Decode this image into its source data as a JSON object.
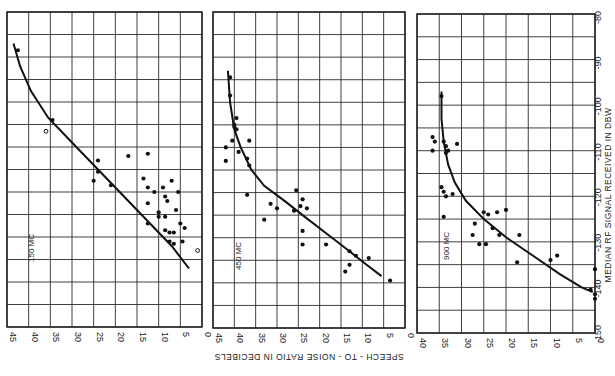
{
  "chart_data": {
    "type": "scatter",
    "orientation_note": "Figure printed rotated 90 degrees clockwise",
    "shared": {
      "xlabel": "SPEECH - TO - NOISE RATIO IN DECIBELS",
      "ylabel": "MEDIAN RF SIGNAL RECEIVED IN DBW",
      "rf_ticks": [
        "-80",
        "-90",
        "-100",
        "-110",
        "-120",
        "-130",
        "-140",
        "-150"
      ],
      "rf_range": [
        -150,
        -80
      ],
      "grid": true
    },
    "panels": [
      {
        "label": "150 MC",
        "sn_ticks": [
          "45",
          "40",
          "35",
          "30",
          "25",
          "20",
          "15",
          "10",
          "5",
          "0"
        ],
        "sn_range": [
          0,
          45
        ],
        "curve": [
          [
            43.5,
            -87
          ],
          [
            42,
            -92
          ],
          [
            39.5,
            -97.5
          ],
          [
            35.5,
            -103.5
          ],
          [
            30,
            -109
          ],
          [
            24,
            -115
          ],
          [
            18,
            -121
          ],
          [
            12,
            -127
          ],
          [
            7,
            -132
          ],
          [
            3,
            -137
          ]
        ],
        "points": [
          {
            "sn": 42.5,
            "rf": -88.5
          },
          {
            "sn": 34.5,
            "rf": -104
          },
          {
            "sn": 36,
            "rf": -106.5,
            "open": true
          },
          {
            "sn": 24,
            "rf": -113
          },
          {
            "sn": 24,
            "rf": -115.5
          },
          {
            "sn": 25,
            "rf": -117.5
          },
          {
            "sn": 21,
            "rf": -118.5
          },
          {
            "sn": 17,
            "rf": -112
          },
          {
            "sn": 12.5,
            "rf": -111.5
          },
          {
            "sn": 13.5,
            "rf": -117
          },
          {
            "sn": 12.5,
            "rf": -119
          },
          {
            "sn": 11,
            "rf": -120
          },
          {
            "sn": 12.5,
            "rf": -122.5
          },
          {
            "sn": 12.5,
            "rf": -127
          },
          {
            "sn": 9,
            "rf": -119
          },
          {
            "sn": 8.5,
            "rf": -121
          },
          {
            "sn": 8,
            "rf": -122
          },
          {
            "sn": 7,
            "rf": -117.5
          },
          {
            "sn": 5.5,
            "rf": -120
          },
          {
            "sn": 10,
            "rf": -124.5
          },
          {
            "sn": 10,
            "rf": -125.5
          },
          {
            "sn": 8.5,
            "rf": -125.5
          },
          {
            "sn": 6,
            "rf": -124
          },
          {
            "sn": 5,
            "rf": -127
          },
          {
            "sn": 8.5,
            "rf": -128.5
          },
          {
            "sn": 7.5,
            "rf": -129
          },
          {
            "sn": 6.5,
            "rf": -129
          },
          {
            "sn": 4,
            "rf": -128
          },
          {
            "sn": 7.5,
            "rf": -131
          },
          {
            "sn": 6.5,
            "rf": -131.5
          },
          {
            "sn": 4.5,
            "rf": -131
          },
          {
            "sn": 1,
            "rf": -133,
            "open": true
          }
        ]
      },
      {
        "label": "450 MC",
        "sn_ticks": [
          "45",
          "40",
          "35",
          "30",
          "25",
          "20",
          "15",
          "10",
          "5",
          "0"
        ],
        "sn_range": [
          0,
          45
        ],
        "curve": [
          [
            41.5,
            -93
          ],
          [
            41,
            -100
          ],
          [
            40,
            -106
          ],
          [
            38.5,
            -110
          ],
          [
            36,
            -115
          ],
          [
            33,
            -118.5
          ],
          [
            28,
            -122
          ],
          [
            24,
            -125
          ],
          [
            18.5,
            -129
          ],
          [
            13,
            -133
          ],
          [
            9,
            -136
          ],
          [
            5.5,
            -138.5
          ]
        ],
        "points": [
          {
            "sn": 41,
            "rf": -94.5
          },
          {
            "sn": 41,
            "rf": -98.5
          },
          {
            "sn": 39.5,
            "rf": -103.5
          },
          {
            "sn": 40,
            "rf": -105
          },
          {
            "sn": 40,
            "rf": -105.5
          },
          {
            "sn": 39.5,
            "rf": -106
          },
          {
            "sn": 40.5,
            "rf": -108.5
          },
          {
            "sn": 42,
            "rf": -110
          },
          {
            "sn": 36.5,
            "rf": -108.5
          },
          {
            "sn": 39,
            "rf": -111
          },
          {
            "sn": 42,
            "rf": -113
          },
          {
            "sn": 37,
            "rf": -112.5
          },
          {
            "sn": 36.5,
            "rf": -114
          },
          {
            "sn": 37,
            "rf": -120.5
          },
          {
            "sn": 25.5,
            "rf": -119.5
          },
          {
            "sn": 31.5,
            "rf": -122.5
          },
          {
            "sn": 30,
            "rf": -123.5
          },
          {
            "sn": 33,
            "rf": -126
          },
          {
            "sn": 24,
            "rf": -121.5
          },
          {
            "sn": 24.5,
            "rf": -123
          },
          {
            "sn": 26,
            "rf": -124
          },
          {
            "sn": 23,
            "rf": -123.5
          },
          {
            "sn": 24,
            "rf": -128.5
          },
          {
            "sn": 24,
            "rf": -131.5
          },
          {
            "sn": 18.5,
            "rf": -131.5
          },
          {
            "sn": 13,
            "rf": -133
          },
          {
            "sn": 11.5,
            "rf": -134
          },
          {
            "sn": 8.5,
            "rf": -134.5
          },
          {
            "sn": 13,
            "rf": -136
          },
          {
            "sn": 14,
            "rf": -137.5
          },
          {
            "sn": 3.5,
            "rf": -139.5
          }
        ]
      },
      {
        "label": "900 MC",
        "sn_ticks": [
          "40",
          "35",
          "30",
          "25",
          "20",
          "15",
          "10",
          "5",
          "0"
        ],
        "sn_range": [
          0,
          40
        ],
        "curve": [
          [
            34.5,
            -97
          ],
          [
            34.5,
            -103
          ],
          [
            34,
            -108
          ],
          [
            33,
            -113
          ],
          [
            31.5,
            -117
          ],
          [
            29,
            -121
          ],
          [
            25,
            -125
          ],
          [
            20,
            -129
          ],
          [
            14,
            -133
          ],
          [
            8,
            -137
          ],
          [
            3,
            -140
          ],
          [
            0.5,
            -141
          ]
        ],
        "points": [
          {
            "sn": 34.5,
            "rf": -98
          },
          {
            "sn": 36.5,
            "rf": -107
          },
          {
            "sn": 36,
            "rf": -108
          },
          {
            "sn": 36.5,
            "rf": -110
          },
          {
            "sn": 34,
            "rf": -108
          },
          {
            "sn": 33.5,
            "rf": -109
          },
          {
            "sn": 33,
            "rf": -110
          },
          {
            "sn": 33.5,
            "rf": -110.5
          },
          {
            "sn": 31,
            "rf": -108.5
          },
          {
            "sn": 34.5,
            "rf": -118
          },
          {
            "sn": 34,
            "rf": -119
          },
          {
            "sn": 33.5,
            "rf": -120
          },
          {
            "sn": 32,
            "rf": -119.5
          },
          {
            "sn": 34,
            "rf": -124.5
          },
          {
            "sn": 27,
            "rf": -126
          },
          {
            "sn": 27.5,
            "rf": -128.5
          },
          {
            "sn": 25,
            "rf": -123.5
          },
          {
            "sn": 24,
            "rf": -124
          },
          {
            "sn": 22,
            "rf": -123.5
          },
          {
            "sn": 20,
            "rf": -123
          },
          {
            "sn": 23,
            "rf": -127
          },
          {
            "sn": 21.5,
            "rf": -128.5
          },
          {
            "sn": 17,
            "rf": -128.5
          },
          {
            "sn": 26,
            "rf": -130.5
          },
          {
            "sn": 24.5,
            "rf": -130.5
          },
          {
            "sn": 17.5,
            "rf": -134.5
          },
          {
            "sn": 10,
            "rf": -134
          },
          {
            "sn": 8.5,
            "rf": -133
          },
          {
            "sn": 1,
            "rf": -140.5
          },
          {
            "sn": 0,
            "rf": -141.5
          },
          {
            "sn": 0,
            "rf": -142.5
          },
          {
            "sn": 0,
            "rf": -136
          }
        ]
      }
    ]
  },
  "labels": {
    "xlabel": "SPEECH - TO - NOISE RATIO IN DECIBELS",
    "ylabel": "MEDIAN RF SIGNAL RECEIVED IN DBW",
    "panel1": "150 MC",
    "panel2": "450 MC",
    "panel3": "900 MC"
  }
}
